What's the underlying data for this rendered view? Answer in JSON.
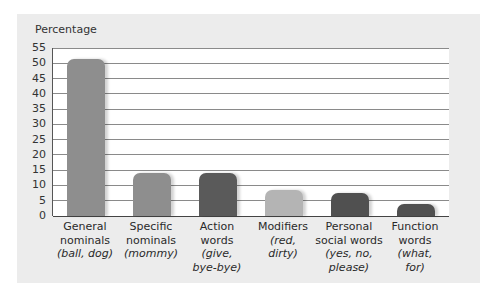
{
  "chart_data": {
    "type": "bar",
    "title": "",
    "ylabel": "Percentage",
    "xlabel": "",
    "ylim": [
      0,
      55
    ],
    "yticks": [
      0,
      5,
      10,
      15,
      20,
      25,
      30,
      35,
      40,
      45,
      50,
      55
    ],
    "grid": true,
    "categories": [
      "General nominals (ball, dog)",
      "Specific nominals (mommy)",
      "Action words (give, bye-bye)",
      "Modifiers (red, dirty)",
      "Personal social words (yes, no, please)",
      "Function words (what, for)"
    ],
    "values": [
      51.5,
      14,
      14,
      8.5,
      7.5,
      4
    ],
    "bar_colors": [
      "#8e8e8e",
      "#8e8e8e",
      "#5a5a5a",
      "#b4b4b4",
      "#505050",
      "#505050"
    ]
  },
  "labels": [
    {
      "line1": "General",
      "line2": "nominals",
      "ex": [
        "(ball, dog)"
      ]
    },
    {
      "line1": "Specific",
      "line2": "nominals",
      "ex": [
        "(mommy)"
      ]
    },
    {
      "line1": "Action",
      "line2": "words",
      "ex": [
        "(give,",
        "bye-bye)"
      ]
    },
    {
      "line1": "Modifiers",
      "line2": "",
      "ex": [
        "(red,",
        "dirty)"
      ]
    },
    {
      "line1": "Personal",
      "line2": "social words",
      "ex": [
        "(yes, no,",
        "please)"
      ]
    },
    {
      "line1": "Function",
      "line2": "words",
      "ex": [
        "(what,",
        "for)"
      ]
    }
  ]
}
